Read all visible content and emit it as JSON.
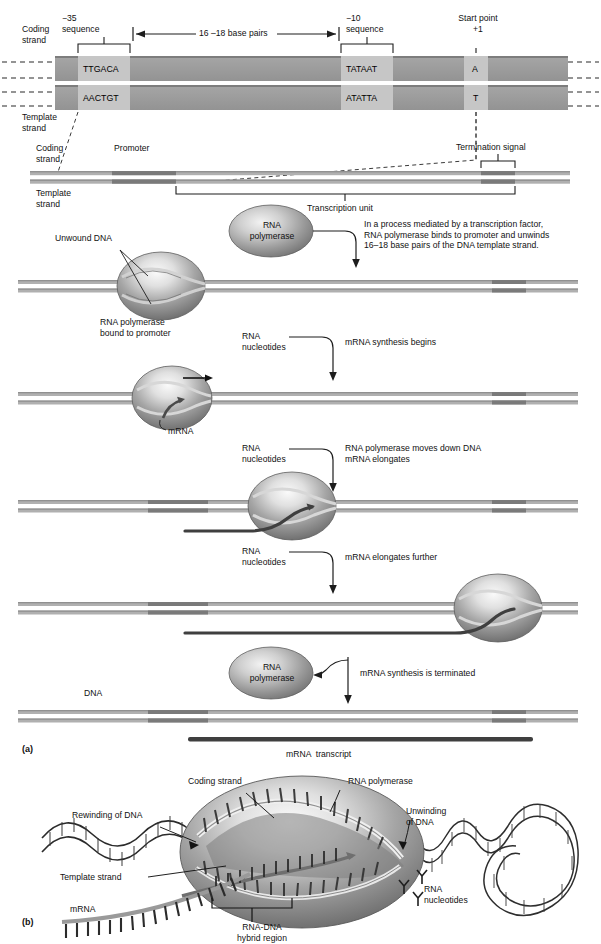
{
  "figure": {
    "panel_a_tag": "(a)",
    "panel_b_tag": "(b)"
  },
  "promoter_map": {
    "coding_strand_label": "Coding\nstrand",
    "template_strand_label": "Template\nstrand",
    "minus35_label": "−35\nsequence",
    "minus10_label": "−10\nsequence",
    "spacer_label": "16 –18 base pairs",
    "start_point_label": "Start point\n+1",
    "coding_minus35_seq": "TTGACA",
    "coding_minus10_seq": "TATAAT",
    "coding_start_base": "A",
    "template_minus35_seq": "AACTGT",
    "template_minus10_seq": "ATATTA",
    "template_start_base": "T"
  },
  "gene_map": {
    "coding_strand_label": "Coding\nstrand",
    "template_strand_label": "Template\nstrand",
    "promoter_label": "Promoter",
    "termination_signal_label": "Termination signal",
    "transcription_unit_label": "Transcription unit"
  },
  "steps": [
    {
      "id": "binding",
      "reagent_label": "RNA\npolymerase",
      "description": "In a process mediated by a transcription factor,\nRNA polymerase binds to promoter and unwinds\n16–18 base pairs of the DNA template strand.",
      "annotation_unwound": "Unwound DNA",
      "annotation_bound": "RNA polymerase\nbound to promoter"
    },
    {
      "id": "initiation",
      "reagent_label": "RNA\nnucleotides",
      "description": "mRNA synthesis begins",
      "annotation_mrna": "mRNA"
    },
    {
      "id": "elongation-1",
      "reagent_label": "RNA\nnucleotides",
      "description": "RNA polymerase moves down DNA\nmRNA elongates"
    },
    {
      "id": "elongation-2",
      "reagent_label": "RNA\nnucleotides",
      "description": "mRNA elongates further"
    },
    {
      "id": "termination",
      "reagent_label": "RNA\npolymerase",
      "description": "mRNA synthesis is terminated"
    }
  ],
  "final": {
    "dna_label": "DNA",
    "transcript_label": "mRNA  transcript"
  },
  "closeup": {
    "coding_strand_label": "Coding strand",
    "rna_polymerase_label": "RNA polymerase",
    "rewinding_label": "Rewinding of DNA",
    "unwinding_label": "Unwinding\nof DNA",
    "template_strand_label": "Template strand",
    "rna_nucleotides_label": "RNA\nnucleotides",
    "mrna_label": "mRNA",
    "hybrid_region_label": "RNA-DNA\nhybrid region"
  },
  "colors": {
    "dna_dark": "#8a8a8a",
    "dna_mid": "#a8a8a8",
    "dna_light": "#c9c9c9",
    "promoter_band": "#787878",
    "bar_fill": "#9e9e9e",
    "bar_highlight": "#c4c4c4",
    "enzyme_dark": "#6f6f6f",
    "enzyme_light": "#e6e6e6",
    "mrna": "#4a4a4a",
    "ink": "#111111"
  }
}
